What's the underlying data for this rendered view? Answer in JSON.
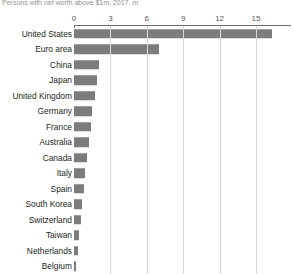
{
  "chart_data": {
    "type": "bar",
    "title": "Persons with net worth above $1m, 2017, m",
    "xlabel": "",
    "ylabel": "",
    "orientation": "horizontal",
    "grid": true,
    "legend": null,
    "xlim": [
      0,
      17.8
    ],
    "xticks": [
      0,
      3,
      6,
      9,
      12,
      15
    ],
    "xtick_labels": [
      "0",
      "3",
      "6",
      "9",
      "12",
      "15"
    ],
    "bar_color": "#7c7c7c",
    "categories": [
      "United States",
      "Euro area",
      "China",
      "Japan",
      "United Kingdom",
      "Germany",
      "France",
      "Australia",
      "Canada",
      "Italy",
      "Spain",
      "South Korea",
      "Switzerland",
      "Taiwan",
      "Netherlands",
      "Belgium"
    ],
    "values": [
      16.3,
      7.0,
      2.1,
      1.9,
      1.7,
      1.5,
      1.4,
      1.2,
      1.1,
      0.9,
      0.8,
      0.7,
      0.6,
      0.4,
      0.3,
      0.2
    ]
  }
}
